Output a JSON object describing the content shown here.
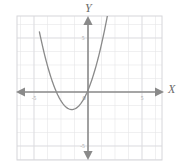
{
  "chart_data": {
    "type": "line",
    "title": "",
    "xlabel": "X",
    "ylabel": "Y",
    "xlim": [
      -5.9,
      5.9
    ],
    "ylim": [
      -5.9,
      5.9
    ],
    "grid": true,
    "grid_step": 1,
    "legend": "none",
    "axis_arrows": "both",
    "x_ticks": [
      -5,
      5
    ],
    "x_tick_labels": [
      "-5",
      "5"
    ],
    "y_ticks": [
      5,
      -5
    ],
    "y_tick_labels": [
      "5",
      "-5"
    ],
    "origin_label": "0",
    "series": [
      {
        "name": "parabola",
        "equation": "y = x^2 + 2.4x + 0.2",
        "vertex": [
          -1.2,
          -1.3
        ],
        "roots": [
          -2.5,
          0.1
        ],
        "opens": "up",
        "x": [
          -2.9,
          -2.7,
          -2.5,
          -2.3,
          -2.1,
          -1.9,
          -1.7,
          -1.5,
          -1.3,
          -1.2,
          -1.1,
          -0.9,
          -0.7,
          -0.5,
          -0.3,
          -0.1,
          0.1,
          0.3,
          0.5,
          0.7,
          0.9,
          1.1,
          1.3,
          1.5
        ],
        "y": [
          1.85,
          1.1,
          0.45,
          -0.11,
          -0.55,
          -0.9,
          -1.13,
          -1.25,
          -1.27,
          -1.3,
          -1.25,
          -1.13,
          -0.9,
          -0.55,
          -0.11,
          0.45,
          1.1,
          1.85,
          2.65,
          3.55,
          4.55,
          5.65,
          6.85,
          8.05
        ]
      }
    ],
    "colors": {
      "curve": "#8a8a8a",
      "axis": "#8a8a8a",
      "grid": "#e2e2e4",
      "border": "#d8d8dc",
      "tick_label": "#a8a8a8",
      "axis_label": "#6b6b6b",
      "background": "#ffffff"
    }
  },
  "figure": {
    "y_axis_name": "Y",
    "x_axis_name": "X"
  }
}
